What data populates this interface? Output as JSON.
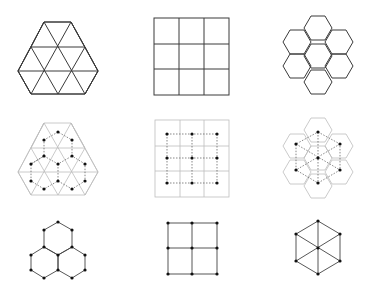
{
  "figure": {
    "rows": [
      {
        "name": "tilings",
        "items": [
          "triangular-tiling",
          "square-tiling",
          "hexagonal-tiling"
        ]
      },
      {
        "name": "tilings-with-dual-overlay",
        "items": [
          "triangular-with-hexagonal-dual",
          "square-with-square-dual",
          "hexagonal-with-triangular-dual"
        ]
      },
      {
        "name": "dual-graphs",
        "items": [
          "hexagonal-graph",
          "square-grid-graph",
          "triangular-wheel-graph"
        ]
      }
    ],
    "colors": {
      "line": "#3a3a3a",
      "faint_line": "#bdbdbd",
      "dual_dash": "#555555",
      "vertex": "#111111",
      "background": "#ffffff"
    }
  }
}
